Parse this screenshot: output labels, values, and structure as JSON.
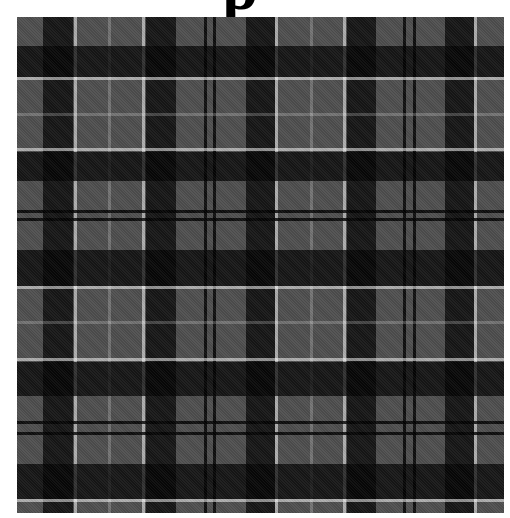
{
  "heading": {
    "visible_glyph": "p"
  },
  "image": {
    "subject": "grey-and-black tartan plaid fabric pattern",
    "colors": {
      "base_gray": "#4e4e4e",
      "dark_band": "#1c1c1c",
      "near_black_intersection": "#0a0a0a",
      "light_line": "#b4b4b4",
      "thin_line": "#6a6a6a",
      "thin_dark_line": "#161616"
    },
    "vertical_stripes": [
      {
        "type": "dark",
        "x": 26,
        "w": 30
      },
      {
        "type": "light",
        "x": 57,
        "w": 3
      },
      {
        "type": "thin",
        "x": 91,
        "w": 3
      },
      {
        "type": "light",
        "x": 125,
        "w": 3
      },
      {
        "type": "dark",
        "x": 129,
        "w": 30
      },
      {
        "type": "thindark",
        "x": 187,
        "w": 3
      },
      {
        "type": "thindark",
        "x": 196,
        "w": 3
      },
      {
        "type": "dark",
        "x": 229,
        "w": 29
      },
      {
        "type": "light",
        "x": 258,
        "w": 3
      },
      {
        "type": "thin",
        "x": 293,
        "w": 3
      },
      {
        "type": "light",
        "x": 326,
        "w": 3
      },
      {
        "type": "dark",
        "x": 330,
        "w": 29
      },
      {
        "type": "thindark",
        "x": 386,
        "w": 3
      },
      {
        "type": "thindark",
        "x": 396,
        "w": 3
      },
      {
        "type": "dark",
        "x": 428,
        "w": 29
      },
      {
        "type": "light",
        "x": 457,
        "w": 3
      }
    ],
    "horizontal_stripes": [
      {
        "type": "dark",
        "y": 29,
        "h": 31
      },
      {
        "type": "light",
        "y": 60,
        "h": 3
      },
      {
        "type": "thin",
        "y": 96,
        "h": 3
      },
      {
        "type": "light",
        "y": 131,
        "h": 3
      },
      {
        "type": "dark",
        "y": 135,
        "h": 29
      },
      {
        "type": "thindark",
        "y": 193,
        "h": 3
      },
      {
        "type": "thindark",
        "y": 201,
        "h": 3
      },
      {
        "type": "dark",
        "y": 233,
        "h": 36
      },
      {
        "type": "light",
        "y": 269,
        "h": 3
      },
      {
        "type": "thin",
        "y": 304,
        "h": 3
      },
      {
        "type": "light",
        "y": 341,
        "h": 3
      },
      {
        "type": "dark",
        "y": 345,
        "h": 34
      },
      {
        "type": "thindark",
        "y": 404,
        "h": 3
      },
      {
        "type": "thindark",
        "y": 415,
        "h": 3
      },
      {
        "type": "dark",
        "y": 447,
        "h": 35
      },
      {
        "type": "light",
        "y": 482,
        "h": 3
      }
    ]
  }
}
